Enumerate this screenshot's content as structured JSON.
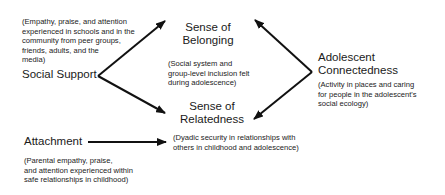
{
  "nodes": {
    "social_support": {
      "label": "Social Support",
      "description": "(Empathy, praise, and attention experienced in schools and in the community from peer groups, friends, adults, and the media)",
      "desc_lines": [
        "(Empathy, praise, and attention",
        "experienced in schools and in the",
        "community from peer groups,",
        "friends, adults, and the",
        "media)"
      ]
    },
    "belonging": {
      "label_lines": [
        "Sense of",
        "Belonging"
      ],
      "desc_lines": [
        "(Social system and",
        "group-level inclusion felt",
        "during adolescence)"
      ]
    },
    "connectedness": {
      "label_lines": [
        "Adolescent",
        "Connectedness"
      ],
      "desc_lines": [
        "(Activity in places and caring",
        "for people in the adolescent's",
        "social ecology)"
      ]
    },
    "relatedness": {
      "label_lines": [
        "Sense of",
        "Relatedness"
      ],
      "desc_lines": [
        "(Dyadic security in relationships with",
        "others in childhood and adolescence)"
      ]
    },
    "attachment": {
      "label": "Attachment",
      "desc_lines": [
        "(Parental empathy, praise,",
        "and attention experienced within",
        "safe relationships in childhood)"
      ]
    }
  },
  "edges": [
    {
      "from": "Social Support",
      "to": "Sense of Belonging"
    },
    {
      "from": "Social Support",
      "to": "Sense of Relatedness"
    },
    {
      "from": "Adolescent Connectedness",
      "to": "Sense of Belonging"
    },
    {
      "from": "Adolescent Connectedness",
      "to": "Sense of Relatedness"
    },
    {
      "from": "Attachment",
      "to": "Sense of Relatedness"
    }
  ],
  "colors": {
    "line": "#111111",
    "text": "#1a1a1a",
    "background": "#ffffff"
  }
}
